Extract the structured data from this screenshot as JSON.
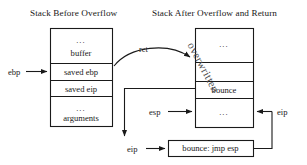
{
  "diagram": {
    "titles": {
      "left": "Stack Before Overflow",
      "right": "Stack After Overflow and Return"
    },
    "left_stack": {
      "name": "Stack Before Overflow",
      "rows": [
        {
          "dots": "...",
          "label": "buffer"
        },
        {
          "dots": "",
          "label": "saved ebp"
        },
        {
          "dots": "",
          "label": "saved eip"
        },
        {
          "dots": "...",
          "label": "arguments"
        }
      ]
    },
    "right_stack": {
      "name": "Stack After Overflow and Return",
      "overlay_label": "overwritten",
      "rows": [
        {
          "dots": "...",
          "label": ""
        },
        {
          "dots": "",
          "label": ""
        },
        {
          "dots": "",
          "label": "bounce"
        },
        {
          "dots": "...",
          "label": ""
        }
      ]
    },
    "code_box": {
      "label": "bounce: jmp esp"
    },
    "annotations": {
      "ebp": "ebp",
      "ret": "ret",
      "esp": "esp",
      "eip_right": "eip",
      "eip_bottom": "eip"
    },
    "colors": {
      "stroke": "#1a1a1a",
      "background": "#ffffff",
      "overlay_text": "#4a4a4a"
    }
  }
}
